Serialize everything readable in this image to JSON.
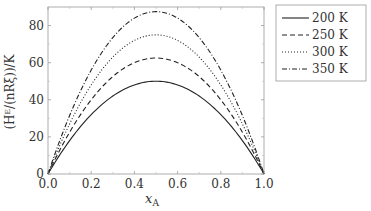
{
  "chart_data": {
    "type": "line",
    "title": "",
    "xlabel": "x_A",
    "ylabel": "(H^E/(nRξ))/K",
    "xlim": [
      0.0,
      1.0
    ],
    "ylim": [
      0,
      90
    ],
    "xticks": [
      "0.0",
      "0.2",
      "0.4",
      "0.6",
      "0.8",
      "1.0"
    ],
    "yticks": [
      "0",
      "20",
      "40",
      "60",
      "80"
    ],
    "grid": false,
    "legend_position": "upper right outside",
    "series": [
      {
        "name": "200 K",
        "style": "solid",
        "peak": 50,
        "formula": "200*x*(1-x)"
      },
      {
        "name": "250 K",
        "style": "dashed",
        "peak": 62.5,
        "formula": "250*x*(1-x)"
      },
      {
        "name": "300 K",
        "style": "dotted",
        "peak": 75,
        "formula": "300*x*(1-x)"
      },
      {
        "name": "350 K",
        "style": "dashdot",
        "peak": 87.5,
        "formula": "350*x*(1-x)"
      }
    ],
    "x": [
      0.0,
      0.1,
      0.2,
      0.3,
      0.4,
      0.5,
      0.6,
      0.7,
      0.8,
      0.9,
      1.0
    ],
    "values": {
      "200 K": [
        0,
        18,
        32,
        42,
        48,
        50,
        48,
        42,
        32,
        18,
        0
      ],
      "250 K": [
        0,
        22.5,
        40,
        52.5,
        60,
        62.5,
        60,
        52.5,
        40,
        22.5,
        0
      ],
      "300 K": [
        0,
        27,
        48,
        63,
        72,
        75,
        72,
        63,
        48,
        27,
        0
      ],
      "350 K": [
        0,
        31.5,
        56,
        73.5,
        84,
        87.5,
        84,
        73.5,
        56,
        31.5,
        0
      ]
    }
  },
  "legend": {
    "items": [
      "200 K",
      "250 K",
      "300 K",
      "350 K"
    ]
  },
  "axes": {
    "xlabel_main": "x",
    "xlabel_sub": "A",
    "ylabel_text": "(Hᴱ/(nRξ))/K"
  }
}
